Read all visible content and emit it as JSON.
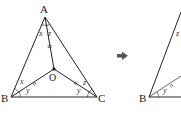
{
  "figure_left": {
    "vertices": {
      "A": "A",
      "B": "B",
      "C": "C",
      "O": "O"
    },
    "angle_labels": {
      "at_A_left": "x",
      "at_A_right": "z",
      "at_B_upper": "x",
      "at_B_lower": "y",
      "at_C_upper": "z",
      "at_C_lower": "y"
    }
  },
  "arrow": {
    "icon": "right-arrow-icon",
    "glyph": "➡"
  },
  "figure_right": {
    "vertices": {
      "B": "B"
    },
    "angle_labels": {
      "at_B_lower": "y",
      "at_A_left": "z"
    }
  },
  "colors": {
    "line": "#222222",
    "arrow": "#555555"
  }
}
